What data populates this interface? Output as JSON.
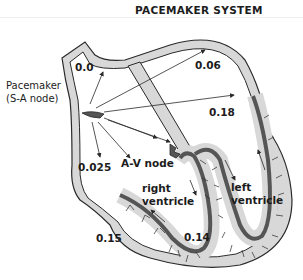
{
  "title": "PACEMAKER SYSTEM",
  "labels": {
    "pacemaker_line1": "Pacemaker",
    "pacemaker_line2": "(S-A node)",
    "av_node": "A-V node",
    "right_ventricle_line1": "right",
    "right_ventricle_line2": "ventricle",
    "left_ventricle_line1": "left",
    "left_ventricle_line2": "ventricle"
  },
  "timings": {
    "sa_node": "0.0",
    "left_atrium": "0.06",
    "left_ventricle_wall": "0.18",
    "right_atrium_lower": "0.025",
    "right_ventricle_base": "0.15",
    "septum_apex": "0.14"
  },
  "colors": {
    "outline": "#2a2a2a",
    "wall_fill": "#d8d8d8",
    "conduction_fill": "#555555",
    "text": "#1c1c1c"
  }
}
